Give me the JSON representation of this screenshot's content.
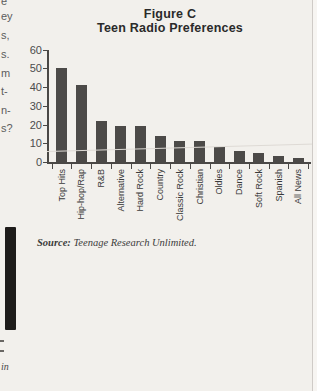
{
  "figure": {
    "title_line1": "Figure C",
    "title_line2": "Teen Radio Preferences",
    "source_label": "Source:",
    "source_text": " Teenage Research Unlimited."
  },
  "chart_data": {
    "type": "bar",
    "categories": [
      "Top Hits",
      "Hip-hop/Rap",
      "R&B",
      "Alternative",
      "Hard Rock",
      "Country",
      "Classic Rock",
      "Christian",
      "Oldies",
      "Dance",
      "Soft Rock",
      "Spanish",
      "All News"
    ],
    "values": [
      50,
      41,
      22,
      19,
      19,
      14,
      11,
      11,
      8,
      6,
      5,
      3,
      2
    ],
    "xlabel": "",
    "ylabel": "",
    "ylim": [
      0,
      60
    ],
    "yticks": [
      0,
      10,
      20,
      30,
      40,
      50,
      60
    ],
    "grid": false,
    "legend": "none",
    "bar_color": "#4c4a48",
    "x_label_rotation": -90
  },
  "page": {
    "background": "#f2f0ec",
    "left_column_fragments": [
      {
        "text": "e",
        "y": -4
      },
      {
        "text": "ey",
        "y": 11
      },
      {
        "text": "s,",
        "y": 30
      },
      {
        "text": "s.",
        "y": 49
      },
      {
        "text": "m",
        "y": 68
      },
      {
        "text": "t-",
        "y": 86
      },
      {
        "text": "n-",
        "y": 105
      },
      {
        "text": "s?",
        "y": 123
      }
    ],
    "margin_note": "in"
  }
}
